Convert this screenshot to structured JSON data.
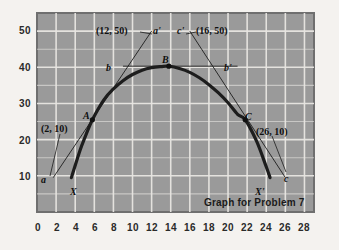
{
  "figure": {
    "caption": "Graph for Problem 7",
    "plot_bg_color": "#9a9a9a",
    "grid_color": "#e8e6e2",
    "curve_color": "#1d1d1d",
    "page_bg_color": "#f4f2ef"
  },
  "chart_data": {
    "type": "line",
    "title": "Graph for Problem 7",
    "xlabel": "",
    "ylabel": "",
    "xlim": [
      0,
      29
    ],
    "ylim": [
      0,
      55
    ],
    "grid": true,
    "legend": "none",
    "x_ticks": [
      0,
      2,
      4,
      6,
      8,
      10,
      12,
      14,
      16,
      18,
      20,
      22,
      24,
      26,
      28
    ],
    "y_ticks": [
      10,
      20,
      30,
      40,
      50
    ],
    "curve": {
      "name": "parabola",
      "description": "downward parabola through X, A, B, C, X'",
      "x": [
        3.6,
        4.5,
        5.0,
        5.8,
        7.0,
        8.0,
        9.0,
        10.0,
        11.0,
        12.0,
        13.0,
        13.8,
        15.0,
        16.0,
        17.0,
        18.0,
        19.0,
        20.0,
        21.0,
        21.8,
        23.0,
        24.0,
        24.4
      ],
      "y": [
        9.5,
        17.0,
        20.5,
        25.5,
        31.0,
        34.0,
        36.3,
        38.0,
        39.2,
        39.9,
        40.2,
        40.3,
        39.6,
        38.6,
        37.1,
        35.2,
        32.9,
        30.2,
        27.0,
        25.5,
        19.5,
        12.5,
        9.5
      ]
    },
    "points": [
      {
        "label": "A",
        "x": 5.8,
        "y": 25.5,
        "marker": "dot"
      },
      {
        "label": "B",
        "x": 13.8,
        "y": 40.3,
        "marker": "dot"
      },
      {
        "label": "C",
        "x": 21.8,
        "y": 25.5,
        "marker": "dot"
      }
    ],
    "endpoints": [
      {
        "label": "X",
        "x": 3.6,
        "y": 9.5
      },
      {
        "label": "X'",
        "x": 24.4,
        "y": 9.5
      }
    ],
    "tangent_lines": [
      {
        "id": "a-aprime",
        "start_label": "a",
        "end_label": "a'",
        "annotation": "(12, 50)",
        "x1": 1.7,
        "y1": 9.5,
        "x2": 12.0,
        "y2": 50.0
      },
      {
        "id": "b-bprime",
        "start_label": "b",
        "end_label": "b'",
        "annotation": "",
        "x1": 9.0,
        "y1": 40.3,
        "x2": 21.0,
        "y2": 40.3
      },
      {
        "id": "c-cprime",
        "start_label": "c'",
        "end_label": "c",
        "annotation": "(16, 50)",
        "x1": 16.0,
        "y1": 50.0,
        "x2": 26.0,
        "y2": 9.5
      }
    ],
    "point_annotations": [
      {
        "text": "(2, 10)",
        "x": 2.0,
        "y": 10.0
      },
      {
        "text": "(12, 50)",
        "x": 12.0,
        "y": 50.0
      },
      {
        "text": "(16, 50)",
        "x": 16.0,
        "y": 50.0
      },
      {
        "text": "(26, 10)",
        "x": 26.0,
        "y": 10.0
      }
    ]
  },
  "axes": {
    "y_labels": [
      "50",
      "40",
      "30",
      "20",
      "10"
    ],
    "x_labels": [
      "0",
      "2",
      "4",
      "6",
      "8",
      "10",
      "12",
      "14",
      "16",
      "18",
      "20",
      "22",
      "24",
      "26",
      "28"
    ]
  },
  "annotations": {
    "coord_12_50": "(12, 50)",
    "coord_16_50": "(16, 50)",
    "coord_2_10": "(2, 10)",
    "coord_26_10": "(26, 10)",
    "label_a": "a",
    "label_a_prime": "a'",
    "label_b": "b",
    "label_b_prime": "b'",
    "label_c": "c",
    "label_c_prime": "c'",
    "label_A": "A",
    "label_B": "B",
    "label_C": "C",
    "label_X": "X",
    "label_X_prime": "X'"
  }
}
